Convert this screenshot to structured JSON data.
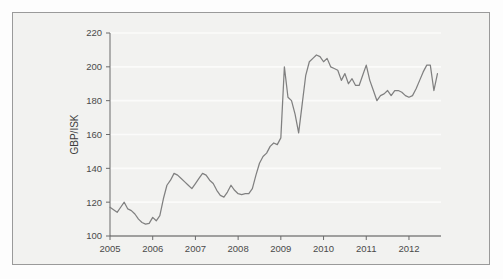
{
  "chart_data": {
    "type": "line",
    "title": "",
    "subtitle": "",
    "xlabel": "",
    "ylabel": "GBP/ISK",
    "xlim": [
      2005.0,
      2012.75
    ],
    "ylim": [
      100,
      220
    ],
    "ytick_labels": [
      "100",
      "120",
      "140",
      "160",
      "180",
      "200",
      "220"
    ],
    "yticks": [
      100,
      120,
      140,
      160,
      180,
      200,
      220
    ],
    "xtick_labels": [
      "2005",
      "2006",
      "2007",
      "2008",
      "2009",
      "2010",
      "2011",
      "2012"
    ],
    "xticks": [
      2005,
      2006,
      2007,
      2008,
      2009,
      2010,
      2011,
      2012
    ],
    "grid": true,
    "grid_orientation": "horizontal",
    "legend": false,
    "legend_position": "none",
    "line_color": "#808080",
    "series": [
      {
        "name": "GBP/ISK",
        "x": [
          2005.0,
          2005.083,
          2005.167,
          2005.25,
          2005.333,
          2005.417,
          2005.5,
          2005.583,
          2005.667,
          2005.75,
          2005.833,
          2005.917,
          2006.0,
          2006.083,
          2006.167,
          2006.25,
          2006.333,
          2006.417,
          2006.5,
          2006.583,
          2006.667,
          2006.75,
          2006.833,
          2006.917,
          2007.0,
          2007.083,
          2007.167,
          2007.25,
          2007.333,
          2007.417,
          2007.5,
          2007.583,
          2007.667,
          2007.75,
          2007.833,
          2007.917,
          2008.0,
          2008.083,
          2008.167,
          2008.25,
          2008.333,
          2008.417,
          2008.5,
          2008.583,
          2008.667,
          2008.75,
          2008.833,
          2008.917,
          2009.0,
          2009.083,
          2009.167,
          2009.25,
          2009.333,
          2009.417,
          2009.5,
          2009.583,
          2009.667,
          2009.75,
          2009.833,
          2009.917,
          2010.0,
          2010.083,
          2010.167,
          2010.25,
          2010.333,
          2010.417,
          2010.5,
          2010.583,
          2010.667,
          2010.75,
          2010.833,
          2010.917,
          2011.0,
          2011.083,
          2011.167,
          2011.25,
          2011.333,
          2011.417,
          2011.5,
          2011.583,
          2011.667,
          2011.75,
          2011.833,
          2011.917,
          2012.0,
          2012.083,
          2012.167,
          2012.25,
          2012.333,
          2012.417,
          2012.5,
          2012.583,
          2012.667
        ],
        "values": [
          117,
          115.5,
          114,
          117,
          120,
          116,
          115,
          113,
          110,
          108,
          107,
          107.5,
          111,
          109,
          112,
          122,
          130,
          133,
          137,
          136,
          134,
          132,
          130,
          128,
          131,
          134,
          137,
          136,
          133,
          131,
          127,
          124,
          123,
          126,
          130,
          127,
          125,
          124.5,
          125,
          125,
          128,
          136,
          143,
          147,
          149,
          153,
          155,
          154,
          158,
          200,
          182,
          180,
          172,
          161,
          178,
          195,
          203,
          205,
          207,
          206,
          203,
          205,
          200,
          199,
          198,
          192,
          196,
          190,
          193,
          189,
          189,
          195,
          201,
          192,
          186,
          180,
          183,
          184,
          186,
          183,
          186,
          186,
          185,
          183,
          182,
          183,
          187,
          192,
          197,
          201,
          201,
          186,
          196
        ]
      }
    ]
  },
  "axis": {
    "y_title": "GBP/ISK"
  }
}
